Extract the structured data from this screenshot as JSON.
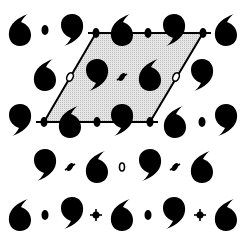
{
  "diagram": {
    "type": "plane-group-pattern",
    "colors": {
      "motif": "#000000",
      "cell_fill": "#d9d9d9",
      "cell_stroke": "#000000",
      "background": "#ffffff"
    },
    "unit_cell": {
      "vertices": [
        [
          96,
          33
        ],
        [
          203,
          33
        ],
        [
          150,
          122
        ],
        [
          44,
          122
        ]
      ]
    },
    "motifs": [
      {
        "kind": "six",
        "x": 20,
        "y": 30
      },
      {
        "kind": "nine",
        "x": 72,
        "y": 30
      },
      {
        "kind": "six",
        "x": 122,
        "y": 30
      },
      {
        "kind": "nine",
        "x": 174,
        "y": 30
      },
      {
        "kind": "six",
        "x": 226,
        "y": 30
      },
      {
        "kind": "six",
        "x": 45,
        "y": 75
      },
      {
        "kind": "nine",
        "x": 97,
        "y": 75
      },
      {
        "kind": "six",
        "x": 150,
        "y": 75
      },
      {
        "kind": "nine",
        "x": 202,
        "y": 75
      },
      {
        "kind": "nine",
        "x": 20,
        "y": 120
      },
      {
        "kind": "six",
        "x": 70,
        "y": 122
      },
      {
        "kind": "nine",
        "x": 122,
        "y": 120
      },
      {
        "kind": "six",
        "x": 175,
        "y": 122
      },
      {
        "kind": "nine",
        "x": 226,
        "y": 120
      },
      {
        "kind": "nine",
        "x": 45,
        "y": 165
      },
      {
        "kind": "six",
        "x": 97,
        "y": 167
      },
      {
        "kind": "nine",
        "x": 150,
        "y": 165
      },
      {
        "kind": "six",
        "x": 202,
        "y": 167
      },
      {
        "kind": "six",
        "x": 20,
        "y": 215
      },
      {
        "kind": "nine",
        "x": 72,
        "y": 213
      },
      {
        "kind": "six",
        "x": 122,
        "y": 215
      },
      {
        "kind": "nine",
        "x": 174,
        "y": 213
      },
      {
        "kind": "six",
        "x": 226,
        "y": 215
      }
    ],
    "symmetry_elements": [
      {
        "kind": "dot",
        "x": 45,
        "y": 30
      },
      {
        "kind": "dot",
        "x": 96,
        "y": 33
      },
      {
        "kind": "dot",
        "x": 148,
        "y": 33
      },
      {
        "kind": "dot",
        "x": 203,
        "y": 33
      },
      {
        "kind": "lens",
        "x": 70,
        "y": 77
      },
      {
        "kind": "cross",
        "x": 122,
        "y": 77
      },
      {
        "kind": "lens",
        "x": 176,
        "y": 77
      },
      {
        "kind": "dot",
        "x": 44,
        "y": 122
      },
      {
        "kind": "dot",
        "x": 97,
        "y": 122
      },
      {
        "kind": "dot",
        "x": 150,
        "y": 122
      },
      {
        "kind": "dot",
        "x": 202,
        "y": 122
      },
      {
        "kind": "cross",
        "x": 70,
        "y": 167
      },
      {
        "kind": "ring",
        "x": 122,
        "y": 167
      },
      {
        "kind": "cross",
        "x": 175,
        "y": 167
      },
      {
        "kind": "dot",
        "x": 45,
        "y": 215
      },
      {
        "kind": "plus",
        "x": 96,
        "y": 215
      },
      {
        "kind": "dot",
        "x": 148,
        "y": 215
      },
      {
        "kind": "plus",
        "x": 200,
        "y": 215
      }
    ]
  }
}
